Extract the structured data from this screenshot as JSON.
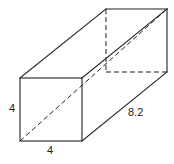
{
  "diagram": {
    "type": "rectangular-prism",
    "colors": {
      "stroke": "#222222",
      "background": "#ffffff"
    },
    "vertices": {
      "front_top_left": [
        20,
        78
      ],
      "front_top_right": [
        82,
        78
      ],
      "front_bottom_left": [
        20,
        141
      ],
      "front_bottom_right": [
        82,
        141
      ],
      "back_top_left": [
        106,
        9
      ],
      "back_top_right": [
        167,
        9
      ],
      "back_bottom_left": [
        106,
        72
      ],
      "back_bottom_right": [
        167,
        72
      ]
    },
    "labels": {
      "height": "4",
      "width": "4",
      "length": "8.2"
    }
  }
}
